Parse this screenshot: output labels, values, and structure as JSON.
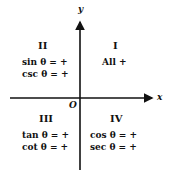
{
  "axes": {
    "x_label": "x",
    "y_label": "y",
    "origin_label": "O"
  },
  "quadrants": [
    {
      "id": "I",
      "label": "I",
      "lines": [
        "All +"
      ]
    },
    {
      "id": "II",
      "label": "II",
      "lines": [
        "sin θ = +",
        "csc θ = +"
      ]
    },
    {
      "id": "III",
      "label": "III",
      "lines": [
        "tan θ = +",
        "cot θ = +"
      ]
    },
    {
      "id": "IV",
      "label": "IV",
      "lines": [
        "cos θ = +",
        "sec θ = +"
      ]
    }
  ],
  "colors": {
    "ink": "#111111",
    "background": "#ffffff"
  }
}
